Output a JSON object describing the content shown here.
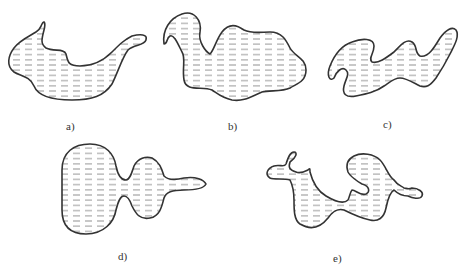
{
  "figure": {
    "hatch_style": "horizontal dashed lines",
    "colors": {
      "outline": "#333333",
      "hatch": "#8a8a8a",
      "background": "#ffffff"
    },
    "panels": [
      {
        "id": "a",
        "label": "a)"
      },
      {
        "id": "b",
        "label": "b)"
      },
      {
        "id": "c",
        "label": "c)"
      },
      {
        "id": "d",
        "label": "d)"
      },
      {
        "id": "e",
        "label": "e)"
      }
    ]
  }
}
